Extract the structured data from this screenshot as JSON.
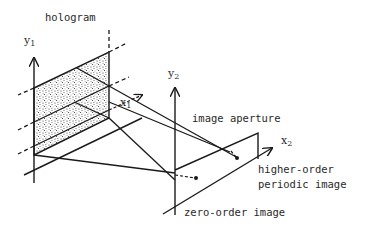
{
  "figure": {
    "labels": {
      "hologram": "hologram",
      "y1": "y",
      "y1_sub": "1",
      "x1": "x",
      "x1_sub": "1",
      "y2": "y",
      "y2_sub": "2",
      "x2": "x",
      "x2_sub": "2",
      "image_aperture": "image aperture",
      "higher_order_line1": "higher-order",
      "higher_order_line2": "periodic image",
      "zero_order": "zero-order image"
    },
    "colors": {
      "ink": "#1a1a1a",
      "stipple": "#555555",
      "background": "#ffffff"
    }
  }
}
